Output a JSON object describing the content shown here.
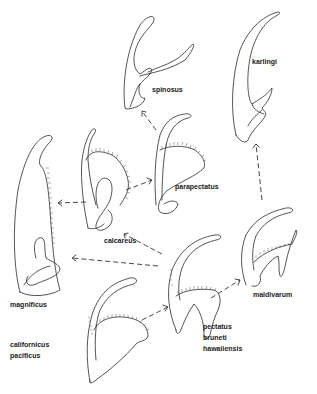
{
  "figure": {
    "labels": {
      "spinosus": "spinosus",
      "karlingi": "karlingi",
      "calcareus": "calcareus",
      "parapectatus": "parapectatus",
      "magnificus": "magnificus",
      "maldivarum": "maldivarum",
      "californicus_group": [
        "californicus",
        "pacificus"
      ],
      "pectatus_group": [
        "pectatus",
        "bruneti",
        "hawaiiensis"
      ]
    },
    "nodes": [
      {
        "id": "californicus-pacificus",
        "label": "californicus / pacificus"
      },
      {
        "id": "pectatus-bruneti-hawaiiensis",
        "label": "pectatus / bruneti / hawaiiensis"
      },
      {
        "id": "maldivarum",
        "label": "maldivarum"
      },
      {
        "id": "karlingi",
        "label": "karlingi"
      },
      {
        "id": "parapectatus",
        "label": "parapectatus"
      },
      {
        "id": "spinosus",
        "label": "spinosus"
      },
      {
        "id": "calcareus",
        "label": "calcareus"
      },
      {
        "id": "magnificus",
        "label": "magnificus"
      }
    ],
    "edges": [
      {
        "from": "californicus-pacificus",
        "to": "pectatus-bruneti-hawaiiensis"
      },
      {
        "from": "pectatus-bruneti-hawaiiensis",
        "to": "maldivarum"
      },
      {
        "from": "pectatus-bruneti-hawaiiensis",
        "to": "magnificus"
      },
      {
        "from": "pectatus-bruneti-hawaiiensis",
        "to": "calcareus"
      },
      {
        "from": "maldivarum",
        "to": "karlingi"
      },
      {
        "from": "calcareus",
        "to": "magnificus"
      },
      {
        "from": "calcareus",
        "to": "parapectatus"
      },
      {
        "from": "parapectatus",
        "to": "spinosus"
      }
    ]
  }
}
